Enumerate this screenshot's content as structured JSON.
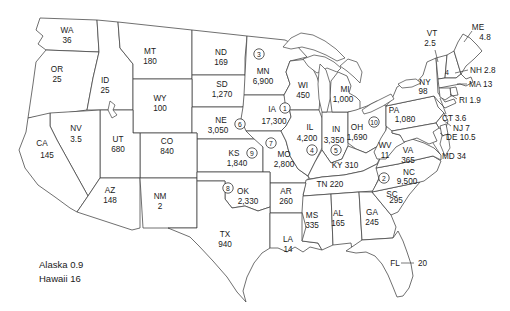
{
  "figure": {
    "colors": {
      "background": "#ffffff",
      "line": "#404040",
      "text": "#1a1a1a"
    }
  },
  "map": {
    "states": [
      {
        "abbr": "WA",
        "value": "36"
      },
      {
        "abbr": "OR",
        "value": "25"
      },
      {
        "abbr": "CA",
        "value": "145"
      },
      {
        "abbr": "NV",
        "value": "3.5"
      },
      {
        "abbr": "ID",
        "value": "25"
      },
      {
        "abbr": "MT",
        "value": "180"
      },
      {
        "abbr": "WY",
        "value": "100"
      },
      {
        "abbr": "UT",
        "value": "680"
      },
      {
        "abbr": "CO",
        "value": "840"
      },
      {
        "abbr": "AZ",
        "value": "148"
      },
      {
        "abbr": "NM",
        "value": "2"
      },
      {
        "abbr": "ND",
        "value": "169"
      },
      {
        "abbr": "SD",
        "value": "1,270"
      },
      {
        "abbr": "NE",
        "value": "3,050",
        "rank": 6
      },
      {
        "abbr": "KS",
        "value": "1,840",
        "rank": 9
      },
      {
        "abbr": "OK",
        "value": "2,330",
        "rank": 8
      },
      {
        "abbr": "TX",
        "value": "940"
      },
      {
        "abbr": "MN",
        "value": "6,900",
        "rank": 3
      },
      {
        "abbr": "IA",
        "value": "17,300",
        "rank": 1
      },
      {
        "abbr": "MO",
        "value": "2,800",
        "rank": 7
      },
      {
        "abbr": "AR",
        "value": "260"
      },
      {
        "abbr": "LA",
        "value": "14"
      },
      {
        "abbr": "WI",
        "value": "450"
      },
      {
        "abbr": "IL",
        "value": "4,200",
        "rank": 4
      },
      {
        "abbr": "IN",
        "value": "3,350",
        "rank": 5
      },
      {
        "abbr": "MI",
        "value": "1,000"
      },
      {
        "abbr": "OH",
        "value": "1,690",
        "rank": 10
      },
      {
        "abbr": "KY",
        "value": "310"
      },
      {
        "abbr": "TN",
        "value": "220"
      },
      {
        "abbr": "MS",
        "value": "335"
      },
      {
        "abbr": "AL",
        "value": "165"
      },
      {
        "abbr": "GA",
        "value": "245"
      },
      {
        "abbr": "FL",
        "value": "20"
      },
      {
        "abbr": "SC",
        "value": "295"
      },
      {
        "abbr": "NC",
        "value": "9,500",
        "rank": 2
      },
      {
        "abbr": "VA",
        "value": "365"
      },
      {
        "abbr": "WV",
        "value": "11"
      },
      {
        "abbr": "KY2",
        "value": ""
      },
      {
        "abbr": "MD",
        "value": "34"
      },
      {
        "abbr": "DE",
        "value": "10.5"
      },
      {
        "abbr": "NJ",
        "value": "7"
      },
      {
        "abbr": "PA",
        "value": "1,080"
      },
      {
        "abbr": "NY",
        "value": "98"
      },
      {
        "abbr": "CT",
        "value": "3.6"
      },
      {
        "abbr": "RI",
        "value": "1.9"
      },
      {
        "abbr": "MA",
        "value": "13"
      },
      {
        "abbr": "NH",
        "value": "2.8"
      },
      {
        "abbr": "VT",
        "value": "2.5"
      },
      {
        "abbr": "ME",
        "value": "4.8"
      }
    ],
    "inset_states": [
      {
        "name": "Alaska",
        "value": "0.9"
      },
      {
        "name": "Hawaii",
        "value": "16"
      }
    ],
    "stray_annotation": "4"
  }
}
